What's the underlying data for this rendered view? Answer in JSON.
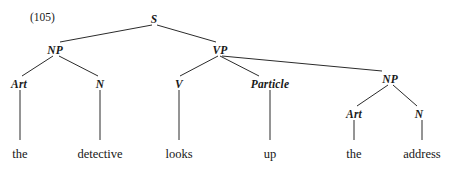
{
  "figure": {
    "kind": "syntax-tree-diagram",
    "example_number": "(105)",
    "example_number_pos": {
      "x": 30,
      "y": 11
    },
    "width": 454,
    "height": 169,
    "background_color": "#ffffff",
    "line_color": "#2b2b2b",
    "text_color": "#171717",
    "sentence": "the detective looks up the address"
  },
  "nodes": [
    {
      "id": "S",
      "label": "S",
      "type": "category",
      "x": 154,
      "y": 14
    },
    {
      "id": "NP1",
      "label": "NP",
      "type": "category",
      "x": 55,
      "y": 45
    },
    {
      "id": "VP",
      "label": "VP",
      "type": "category",
      "x": 220,
      "y": 45
    },
    {
      "id": "Art1",
      "label": "Art",
      "type": "category",
      "x": 19,
      "y": 79
    },
    {
      "id": "N1",
      "label": "N",
      "type": "category",
      "x": 100,
      "y": 79
    },
    {
      "id": "V",
      "label": "V",
      "type": "category",
      "x": 179,
      "y": 79
    },
    {
      "id": "Particle",
      "label": "Particle",
      "type": "category",
      "x": 270,
      "y": 79
    },
    {
      "id": "NP2",
      "label": "NP",
      "type": "category",
      "x": 390,
      "y": 74
    },
    {
      "id": "Art2",
      "label": "Art",
      "type": "category",
      "x": 354,
      "y": 109
    },
    {
      "id": "N2",
      "label": "N",
      "type": "category",
      "x": 419,
      "y": 109
    },
    {
      "id": "w-the1",
      "label": "the",
      "type": "word",
      "x": 20,
      "y": 148
    },
    {
      "id": "w-detective",
      "label": "detective",
      "type": "word",
      "x": 100,
      "y": 148
    },
    {
      "id": "w-looks",
      "label": "looks",
      "type": "word",
      "x": 179,
      "y": 148
    },
    {
      "id": "w-up",
      "label": "up",
      "type": "word",
      "x": 270,
      "y": 148
    },
    {
      "id": "w-the2",
      "label": "the",
      "type": "word",
      "x": 354,
      "y": 148
    },
    {
      "id": "w-address",
      "label": "address",
      "type": "word",
      "x": 422,
      "y": 148
    }
  ],
  "edges": [
    {
      "from": "S",
      "to": "NP1",
      "x1": 152,
      "y1": 25,
      "x2": 60,
      "y2": 42
    },
    {
      "from": "S",
      "to": "VP",
      "x1": 157,
      "y1": 25,
      "x2": 216,
      "y2": 42
    },
    {
      "from": "NP1",
      "to": "Art1",
      "x1": 53,
      "y1": 56,
      "x2": 22,
      "y2": 76
    },
    {
      "from": "NP1",
      "to": "N1",
      "x1": 59,
      "y1": 56,
      "x2": 98,
      "y2": 76
    },
    {
      "from": "VP",
      "to": "V",
      "x1": 218,
      "y1": 56,
      "x2": 180,
      "y2": 76
    },
    {
      "from": "VP",
      "to": "Particle",
      "x1": 220,
      "y1": 56,
      "x2": 259,
      "y2": 76
    },
    {
      "from": "VP",
      "to": "NP2",
      "x1": 222,
      "y1": 56,
      "x2": 382,
      "y2": 71
    },
    {
      "from": "NP2",
      "to": "Art2",
      "x1": 388,
      "y1": 85,
      "x2": 357,
      "y2": 106
    },
    {
      "from": "NP2",
      "to": "N2",
      "x1": 393,
      "y1": 85,
      "x2": 417,
      "y2": 106
    },
    {
      "from": "Art1",
      "to": "w-the1",
      "x1": 20,
      "y1": 90,
      "x2": 20,
      "y2": 140
    },
    {
      "from": "N1",
      "to": "w-detective",
      "x1": 100,
      "y1": 90,
      "x2": 100,
      "y2": 140
    },
    {
      "from": "V",
      "to": "w-looks",
      "x1": 179,
      "y1": 90,
      "x2": 179,
      "y2": 140
    },
    {
      "from": "Particle",
      "to": "w-up",
      "x1": 270,
      "y1": 90,
      "x2": 270,
      "y2": 140
    },
    {
      "from": "Art2",
      "to": "w-the2",
      "x1": 354,
      "y1": 120,
      "x2": 354,
      "y2": 140
    },
    {
      "from": "N2",
      "to": "w-address",
      "x1": 422,
      "y1": 120,
      "x2": 422,
      "y2": 140
    }
  ]
}
